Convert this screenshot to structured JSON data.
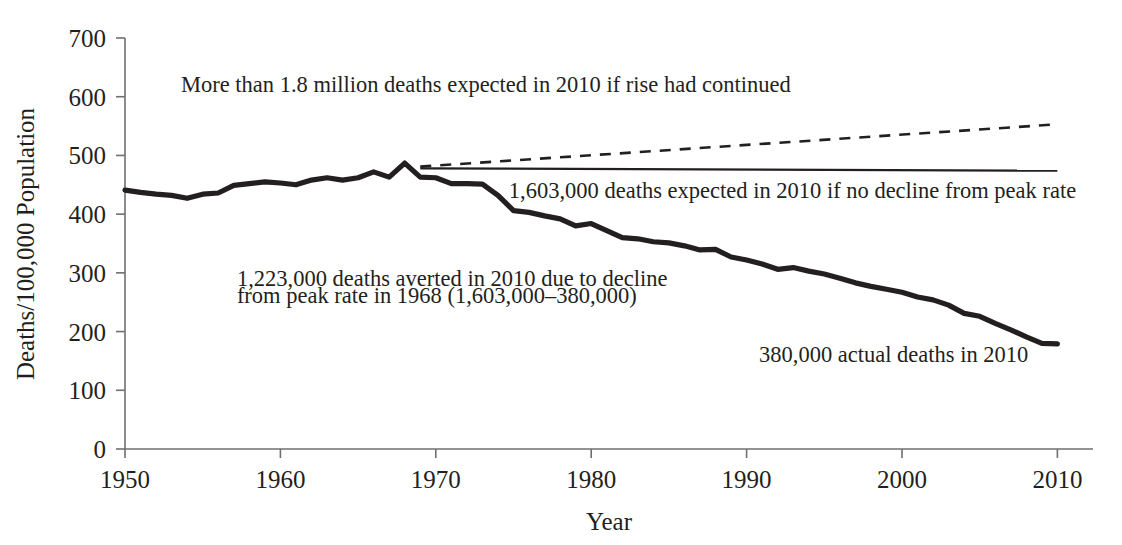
{
  "chart_data": {
    "type": "line",
    "title": "",
    "subtitle": "",
    "xlabel": "Year",
    "ylabel": "Deaths/100,000 Population",
    "xlim": [
      1950,
      2012
    ],
    "ylim": [
      0,
      700
    ],
    "grid": false,
    "legend": "none",
    "x_ticks": [
      "1950",
      "1960",
      "1970",
      "1980",
      "1990",
      "2000",
      "2010"
    ],
    "x_tick_values": [
      1950,
      1960,
      1970,
      1980,
      1990,
      2000,
      2010
    ],
    "y_ticks": [
      "0",
      "100",
      "200",
      "300",
      "400",
      "500",
      "600",
      "700"
    ],
    "y_tick_values": [
      0,
      100,
      200,
      300,
      400,
      500,
      600,
      700
    ],
    "series": [
      {
        "name": "Actual age-adjusted death rate",
        "style": "solid-thick",
        "x": [
          1950,
          1951,
          1952,
          1953,
          1954,
          1955,
          1956,
          1957,
          1958,
          1959,
          1960,
          1961,
          1962,
          1963,
          1964,
          1965,
          1966,
          1967,
          1968,
          1969,
          1970,
          1971,
          1972,
          1973,
          1974,
          1975,
          1976,
          1977,
          1978,
          1979,
          1980,
          1981,
          1982,
          1983,
          1984,
          1985,
          1986,
          1987,
          1988,
          1989,
          1990,
          1991,
          1992,
          1993,
          1994,
          1995,
          1996,
          1997,
          1998,
          1999,
          2000,
          2001,
          2002,
          2003,
          2004,
          2005,
          2006,
          2007,
          2008,
          2009,
          2010
        ],
        "values": [
          441,
          437,
          434,
          432,
          427,
          434,
          436,
          449,
          452,
          455,
          453,
          450,
          458,
          462,
          458,
          462,
          472,
          463,
          487,
          463,
          462,
          452,
          452,
          451,
          432,
          406,
          403,
          397,
          392,
          380,
          384,
          372,
          360,
          358,
          353,
          351,
          346,
          339,
          340,
          327,
          322,
          315,
          306,
          309,
          303,
          298,
          291,
          283,
          277,
          272,
          267,
          259,
          254,
          245,
          231,
          226,
          214,
          203,
          191,
          180,
          179
        ]
      },
      {
        "name": "Expected if no decline from peak rate (1,603,000 deaths)",
        "style": "solid-thin",
        "x": [
          1969,
          2010
        ],
        "values": [
          478,
          474
        ]
      },
      {
        "name": "Expected if rise had continued (more than 1.8 million deaths)",
        "style": "dashed",
        "x": [
          1969,
          2010
        ],
        "values": [
          481,
          553
        ]
      }
    ],
    "annotations": [
      {
        "id": "rise-continued",
        "text": "More than 1.8 million deaths expected in 2010 if rise had continued",
        "x": 1953.6,
        "y": 608,
        "anchor": "start"
      },
      {
        "id": "no-decline",
        "text": "1,603,000 deaths expected in 2010 if no decline from peak rate",
        "x": 1974.7,
        "y": 428,
        "anchor": "start"
      },
      {
        "id": "deaths-averted-line-1",
        "text": "1,223,000 deaths averted in 2010 due to decline",
        "x": 1957.2,
        "y": 278,
        "anchor": "start"
      },
      {
        "id": "deaths-averted-line-2",
        "text": "from peak rate in 1968 (1,603,000–380,000)",
        "x": 1957.2,
        "y": 248,
        "anchor": "start"
      },
      {
        "id": "actual-deaths",
        "text": "380,000 actual deaths in 2010",
        "x": 1990.8,
        "y": 148,
        "anchor": "start"
      }
    ]
  }
}
